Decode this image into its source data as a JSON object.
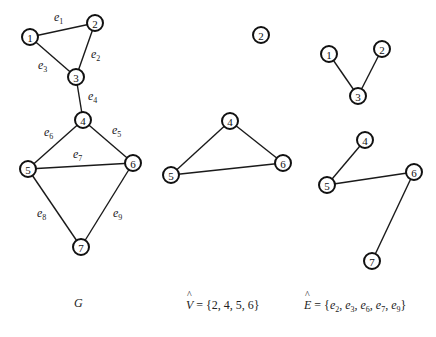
{
  "figure": {
    "graphs": [
      {
        "id": "G",
        "nodes": [
          {
            "id": "1",
            "x": 30,
            "y": 37
          },
          {
            "id": "2",
            "x": 95,
            "y": 23
          },
          {
            "id": "3",
            "x": 76,
            "y": 77
          },
          {
            "id": "4",
            "x": 83,
            "y": 120
          },
          {
            "id": "5",
            "x": 28,
            "y": 169
          },
          {
            "id": "6",
            "x": 133,
            "y": 163
          },
          {
            "id": "7",
            "x": 81,
            "y": 247
          }
        ],
        "edges": [
          {
            "from": "1",
            "to": "2",
            "label": "e",
            "sub": "1",
            "lx": 54,
            "ly": 21
          },
          {
            "from": "2",
            "to": "3",
            "label": "e",
            "sub": "2",
            "lx": 91,
            "ly": 58
          },
          {
            "from": "1",
            "to": "3",
            "label": "e",
            "sub": "3",
            "lx": 38,
            "ly": 69
          },
          {
            "from": "3",
            "to": "4",
            "label": "e",
            "sub": "4",
            "lx": 88,
            "ly": 100
          },
          {
            "from": "4",
            "to": "6",
            "label": "e",
            "sub": "5",
            "lx": 112,
            "ly": 134
          },
          {
            "from": "4",
            "to": "5",
            "label": "e",
            "sub": "6",
            "lx": 44,
            "ly": 136
          },
          {
            "from": "5",
            "to": "6",
            "label": "e",
            "sub": "7",
            "lx": 73,
            "ly": 158
          },
          {
            "from": "5",
            "to": "7",
            "label": "e",
            "sub": "8",
            "lx": 37,
            "ly": 217
          },
          {
            "from": "6",
            "to": "7",
            "label": "e",
            "sub": "9",
            "lx": 113,
            "ly": 217
          }
        ]
      },
      {
        "id": "V-hat-induced",
        "nodes": [
          {
            "id": "2",
            "x": 261,
            "y": 35
          },
          {
            "id": "4",
            "x": 230,
            "y": 121
          },
          {
            "id": "5",
            "x": 171,
            "y": 175
          },
          {
            "id": "6",
            "x": 283,
            "y": 163
          }
        ],
        "edges": [
          {
            "from": "4",
            "to": "5"
          },
          {
            "from": "4",
            "to": "6"
          },
          {
            "from": "5",
            "to": "6"
          }
        ]
      },
      {
        "id": "E-hat-induced",
        "nodes": [
          {
            "id": "1",
            "x": 329,
            "y": 54
          },
          {
            "id": "2",
            "x": 382,
            "y": 49
          },
          {
            "id": "3",
            "x": 358,
            "y": 96
          },
          {
            "id": "4",
            "x": 365,
            "y": 140
          },
          {
            "id": "5",
            "x": 327,
            "y": 185
          },
          {
            "id": "6",
            "x": 414,
            "y": 172
          },
          {
            "id": "7",
            "x": 372,
            "y": 261
          }
        ],
        "edges": [
          {
            "from": "1",
            "to": "3"
          },
          {
            "from": "2",
            "to": "3"
          },
          {
            "from": "4",
            "to": "5"
          },
          {
            "from": "5",
            "to": "6"
          },
          {
            "from": "6",
            "to": "7"
          }
        ]
      }
    ],
    "node_radius": 8
  },
  "captions": {
    "g": {
      "text": "G"
    },
    "v_hat": {
      "var": "V",
      "hat": "^",
      "eq": " = {2, 4, 5, 6}"
    },
    "e_hat": {
      "var": "E",
      "hat": "^",
      "eq": " = {",
      "items": [
        {
          "e": "e",
          "sub": "2",
          "sep": ", "
        },
        {
          "e": "e",
          "sub": "3",
          "sep": ", "
        },
        {
          "e": "e",
          "sub": "6",
          "sep": ", "
        },
        {
          "e": "e",
          "sub": "7",
          "sep": ", "
        },
        {
          "e": "e",
          "sub": "9",
          "sep": ""
        }
      ],
      "close": "}"
    }
  }
}
